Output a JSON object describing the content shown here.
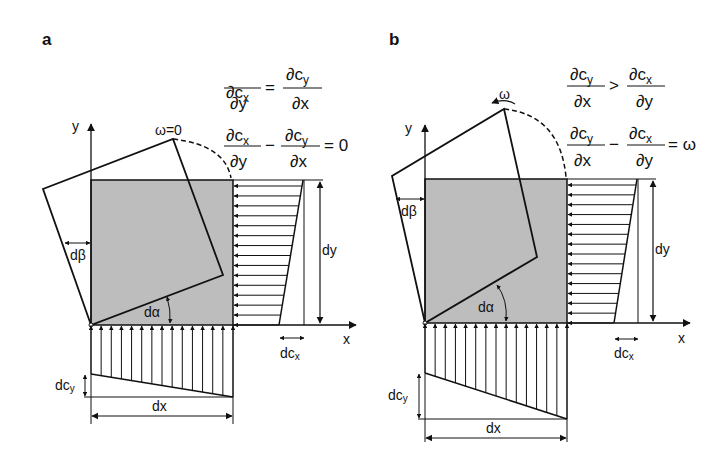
{
  "panels": [
    {
      "label": "a",
      "omega_label": "ω=0",
      "eq1": {
        "lhs_num": "∂c",
        "lhs_num_sub": "x",
        "lhs_den": "∂y",
        "op": "=",
        "rhs_num": "∂c",
        "rhs_num_sub": "y",
        "rhs_den": "∂x"
      },
      "eq2": {
        "lhs_num": "∂c",
        "lhs_num_sub": "x",
        "lhs_den": "∂y",
        "op": "−",
        "rhs_num": "∂c",
        "rhs_num_sub": "y",
        "rhs_den": "∂x",
        "result": "= 0"
      },
      "axis_x": "x",
      "axis_y": "y",
      "d_alpha": "dα",
      "d_beta": "dβ",
      "dim_dx": "dx",
      "dim_dy": "dy",
      "dc_x": "dc",
      "dc_x_sub": "x",
      "dc_y": "dc",
      "dc_y_sub": "y"
    },
    {
      "label": "b",
      "omega_label": "ω",
      "eq1": {
        "lhs_num": "∂c",
        "lhs_num_sub": "y",
        "lhs_den": "∂x",
        "op": ">",
        "rhs_num": "∂c",
        "rhs_num_sub": "x",
        "rhs_den": "∂y"
      },
      "eq2": {
        "lhs_num": "∂c",
        "lhs_num_sub": "y",
        "lhs_den": "∂x",
        "op": "−",
        "rhs_num": "∂c",
        "rhs_num_sub": "x",
        "rhs_den": "∂y",
        "result": "= ω"
      },
      "axis_x": "x",
      "axis_y": "y",
      "d_alpha": "dα",
      "d_beta": "dβ",
      "dim_dx": "dx",
      "dim_dy": "dy",
      "dc_x": "dc",
      "dc_x_sub": "x",
      "dc_y": "dc",
      "dc_y_sub": "y"
    }
  ],
  "colors": {
    "fill_square": "#bdbdbd",
    "stroke": "#111111"
  }
}
